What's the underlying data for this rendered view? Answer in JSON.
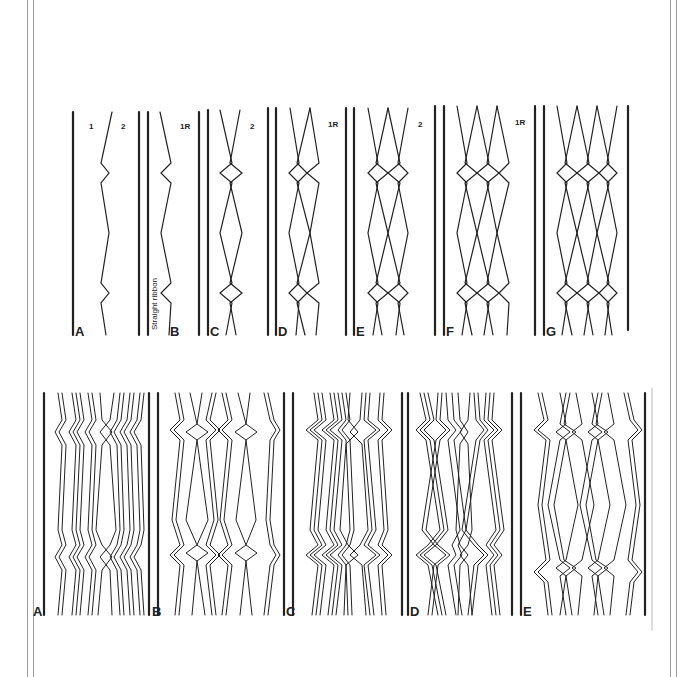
{
  "figure": {
    "top_row": {
      "panels": [
        {
          "id": "A",
          "label": "A",
          "annotations": [
            "1",
            "2"
          ]
        },
        {
          "id": "B",
          "label": "B",
          "annotations": [
            "1R"
          ],
          "side_text": "Straight ribbon"
        },
        {
          "id": "C",
          "label": "C",
          "annotations": [
            "2"
          ]
        },
        {
          "id": "D",
          "label": "D",
          "annotations": [
            "1R"
          ]
        },
        {
          "id": "E",
          "label": "E",
          "annotations": [
            "2"
          ]
        },
        {
          "id": "F",
          "label": "F",
          "annotations": [
            "1R"
          ]
        },
        {
          "id": "G",
          "label": "G",
          "annotations": []
        }
      ]
    },
    "bottom_row": {
      "panels": [
        {
          "id": "A",
          "label": "A"
        },
        {
          "id": "B",
          "label": "B"
        },
        {
          "id": "C",
          "label": "C"
        },
        {
          "id": "D",
          "label": "D"
        },
        {
          "id": "E",
          "label": "E"
        }
      ]
    },
    "colors": {
      "ink": "#222222",
      "border": "#9a9a9a",
      "background": "#ffffff"
    }
  }
}
